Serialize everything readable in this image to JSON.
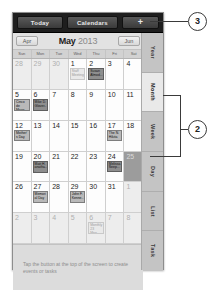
{
  "toolbar": {
    "today_label": "Today",
    "calendars_label": "Calendars",
    "add_label": "+"
  },
  "month_header": {
    "prev_label": "Apr",
    "next_label": "Jun",
    "month": "May",
    "year": "2013"
  },
  "weekdays": [
    "Sun",
    "Mon",
    "Tue",
    "Wed",
    "Thu",
    "Fri",
    "Sat"
  ],
  "grid": {
    "cells": [
      {
        "day": "28",
        "other": true,
        "selected": false,
        "events": []
      },
      {
        "day": "29",
        "other": true,
        "selected": false,
        "events": []
      },
      {
        "day": "30",
        "other": true,
        "selected": false,
        "events": []
      },
      {
        "day": "1",
        "other": false,
        "selected": false,
        "events": [
          {
            "title": "Staff Meeting",
            "style": "faint"
          }
        ]
      },
      {
        "day": "2",
        "other": false,
        "selected": false,
        "events": [
          {
            "title": "Susan Almod...",
            "style": "dark"
          }
        ]
      },
      {
        "day": "3",
        "other": false,
        "selected": false,
        "events": []
      },
      {
        "day": "4",
        "other": false,
        "selected": false,
        "events": []
      },
      {
        "day": "5",
        "other": false,
        "selected": false,
        "events": [
          {
            "title": "Cinco de Mayo",
            "style": "normal"
          }
        ]
      },
      {
        "day": "6",
        "other": false,
        "selected": false,
        "events": [
          {
            "title": "Mike D. Glover...",
            "style": "dark"
          }
        ]
      },
      {
        "day": "7",
        "other": false,
        "selected": false,
        "events": []
      },
      {
        "day": "8",
        "other": false,
        "selected": false,
        "events": []
      },
      {
        "day": "9",
        "other": false,
        "selected": false,
        "events": []
      },
      {
        "day": "10",
        "other": false,
        "selected": false,
        "events": []
      },
      {
        "day": "11",
        "other": false,
        "selected": false,
        "events": []
      },
      {
        "day": "12",
        "other": false,
        "selected": false,
        "events": [
          {
            "title": "Mother's Day",
            "style": "normal"
          }
        ]
      },
      {
        "day": "13",
        "other": false,
        "selected": false,
        "events": []
      },
      {
        "day": "14",
        "other": false,
        "selected": false,
        "events": []
      },
      {
        "day": "15",
        "other": false,
        "selected": false,
        "events": []
      },
      {
        "day": "16",
        "other": false,
        "selected": false,
        "events": []
      },
      {
        "day": "17",
        "other": false,
        "selected": false,
        "events": [
          {
            "title": "The N. Hikita",
            "style": "normal"
          }
        ]
      },
      {
        "day": "18",
        "other": false,
        "selected": false,
        "events": []
      },
      {
        "day": "19",
        "other": false,
        "selected": false,
        "events": []
      },
      {
        "day": "20",
        "other": false,
        "selected": false,
        "events": [
          {
            "title": "Matt H. anatha...",
            "style": "dark"
          }
        ]
      },
      {
        "day": "21",
        "other": false,
        "selected": false,
        "events": []
      },
      {
        "day": "22",
        "other": false,
        "selected": false,
        "events": []
      },
      {
        "day": "23",
        "other": false,
        "selected": false,
        "events": []
      },
      {
        "day": "24",
        "other": false,
        "selected": false,
        "events": [
          {
            "title": "Melissa Seep...",
            "style": "dark"
          }
        ]
      },
      {
        "day": "25",
        "other": false,
        "selected": true,
        "events": []
      },
      {
        "day": "26",
        "other": false,
        "selected": false,
        "events": []
      },
      {
        "day": "27",
        "other": false,
        "selected": false,
        "events": [
          {
            "title": "Memorial Day",
            "style": "normal"
          }
        ]
      },
      {
        "day": "28",
        "other": false,
        "selected": false,
        "events": []
      },
      {
        "day": "29",
        "other": false,
        "selected": false,
        "events": [
          {
            "title": "John F. Kenne...",
            "style": "normal"
          }
        ]
      },
      {
        "day": "30",
        "other": false,
        "selected": false,
        "events": []
      },
      {
        "day": "31",
        "other": false,
        "selected": false,
        "events": []
      },
      {
        "day": "1",
        "other": true,
        "selected": false,
        "events": []
      },
      {
        "day": "2",
        "other": true,
        "selected": false,
        "events": []
      },
      {
        "day": "3",
        "other": true,
        "selected": false,
        "events": []
      },
      {
        "day": "4",
        "other": true,
        "selected": false,
        "events": []
      },
      {
        "day": "5",
        "other": true,
        "selected": false,
        "events": []
      },
      {
        "day": "6",
        "other": true,
        "selected": false,
        "events": [
          {
            "title": "Monthly 23 Mee...",
            "style": "faint"
          }
        ]
      },
      {
        "day": "7",
        "other": true,
        "selected": false,
        "events": []
      },
      {
        "day": "8",
        "other": true,
        "selected": false,
        "events": []
      }
    ]
  },
  "hint": {
    "text": "Tap the button at the top of the screen to create events or tasks"
  },
  "rail": {
    "tabs": [
      {
        "label": "Year",
        "active": false
      },
      {
        "label": "Month",
        "active": true
      },
      {
        "label": "Week",
        "active": false
      },
      {
        "label": "Day",
        "active": false
      },
      {
        "label": "List",
        "active": false
      },
      {
        "label": "Task",
        "active": false
      }
    ]
  },
  "callouts": {
    "three": "3",
    "two": "2"
  }
}
